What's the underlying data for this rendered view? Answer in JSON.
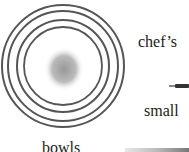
{
  "figures": {
    "bowls": {
      "label": "bowls",
      "icon": "nested-bowls-top-view",
      "ring_color": "#555555",
      "center_color": "#aaaaaa"
    },
    "chefs_knife": {
      "label": "chef’s",
      "icon": "knife"
    },
    "small_knife": {
      "label": "small",
      "icon": "small-knife"
    }
  }
}
